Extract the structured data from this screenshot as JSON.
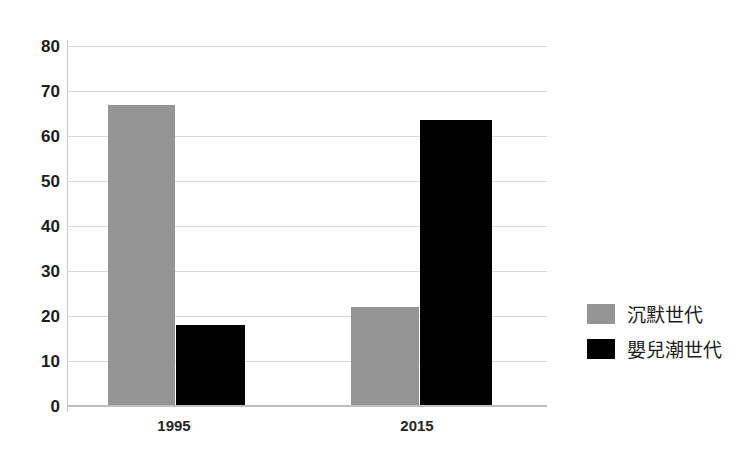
{
  "chart_data": {
    "type": "bar",
    "title": "",
    "xlabel": "",
    "ylabel": "",
    "categories": [
      "1995",
      "2015"
    ],
    "series": [
      {
        "name": "沉默世代",
        "color": "#959595",
        "values": [
          67,
          22
        ]
      },
      {
        "name": "嬰兒潮世代",
        "color": "#000000",
        "values": [
          18,
          63.5
        ]
      }
    ],
    "ylim": [
      0,
      80
    ],
    "yticks": [
      0,
      10,
      20,
      30,
      40,
      50,
      60,
      70,
      80
    ],
    "ytick_labels": [
      "0",
      "10",
      "20",
      "30",
      "40",
      "50",
      "60",
      "70",
      "80"
    ],
    "grid": true,
    "legend_position": "right"
  },
  "legend": {
    "items": [
      {
        "label": "沉默世代",
        "color": "#959595"
      },
      {
        "label": "嬰兒潮世代",
        "color": "#000000"
      }
    ]
  },
  "colors": {
    "silent_generation": "#959595",
    "baby_boomer": "#000000",
    "gridline": "#d9d9d9",
    "axis": "#bfbfbf",
    "background": "#ffffff",
    "text": "#1c1c1c"
  }
}
